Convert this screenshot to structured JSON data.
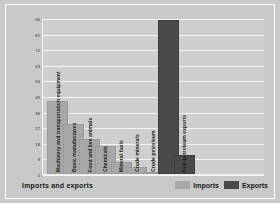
{
  "chart_data": {
    "type": "bar",
    "title": "",
    "xlabel": "Imports and exports",
    "ylabel": "Percentage of total",
    "ylim": [
      0,
      90
    ],
    "yticks": [
      90,
      81,
      72,
      63,
      54,
      45,
      36,
      27,
      18,
      9,
      0
    ],
    "grid": true,
    "legend_position": "bottom-right",
    "categories": [
      "Machinery and transportation equipment",
      "Basic manufactures",
      "Food and live animals",
      "Chemicals",
      "Mineral fuels",
      "Crude minerals",
      "Crude petroleum",
      "Non-petroleum exports"
    ],
    "series": [
      {
        "name": "Imports",
        "color": "#a8a8a8",
        "values": [
          42,
          29,
          20,
          16,
          7,
          4,
          1,
          null
        ]
      },
      {
        "name": "Exports",
        "color": "#4a4a4a",
        "values": [
          null,
          null,
          null,
          null,
          null,
          null,
          89,
          11
        ]
      }
    ],
    "bars": [
      {
        "label": "Machinery and transportation equipment",
        "value": 42,
        "series": "Imports"
      },
      {
        "label": "Basic manufactures",
        "value": 29,
        "series": "Imports"
      },
      {
        "label": "Food and live animals",
        "value": 20,
        "series": "Imports"
      },
      {
        "label": "Chemicals",
        "value": 16,
        "series": "Imports"
      },
      {
        "label": "Mineral fuels",
        "value": 7,
        "series": "Imports"
      },
      {
        "label": "Crude minerals",
        "value": 4,
        "series": "Imports"
      },
      {
        "label": "Crude petroleum",
        "value": 1,
        "series": "Imports"
      },
      {
        "label": "Crude petroleum",
        "value": 89,
        "series": "Exports"
      },
      {
        "label": "Non-petroleum exports",
        "value": 11,
        "series": "Exports"
      }
    ]
  },
  "legend": {
    "items": [
      {
        "label": "Imports",
        "color": "#a8a8a8"
      },
      {
        "label": "Exports",
        "color": "#4a4a4a"
      }
    ]
  }
}
